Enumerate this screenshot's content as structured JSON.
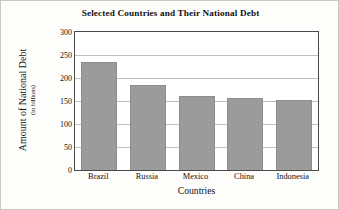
{
  "chart_data": {
    "type": "bar",
    "title": "Selected Countries and Their National Debt",
    "xlabel": "Countries",
    "ylabel": "Amount of National Debt",
    "ylabel_sub": "(in billions)",
    "categories": [
      "Brazil",
      "Russia",
      "Mexico",
      "China",
      "Indonesia"
    ],
    "values": [
      235,
      185,
      160,
      157,
      153
    ],
    "ylim": [
      0,
      300
    ],
    "yticks": [
      0,
      50,
      100,
      150,
      200,
      250,
      300
    ],
    "ytick_labels": [
      "0",
      "50",
      "100",
      "150",
      "200",
      "250",
      "300"
    ],
    "grid": true,
    "legend": false,
    "bar_color": "#9b9b9b",
    "bar_edge_color": "#8d8d8d",
    "grid_color": "#bfbfbf",
    "axis_color": "#4a4a4a",
    "plot_background": "#ffffff",
    "figure_background": "#fdfdfc"
  }
}
